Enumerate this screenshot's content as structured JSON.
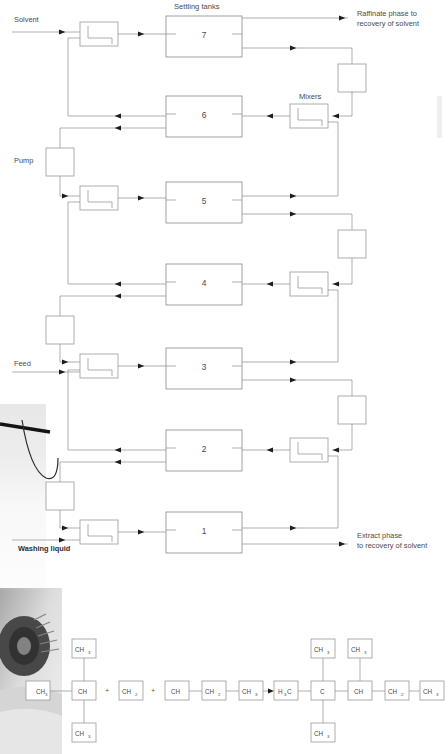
{
  "diagram": {
    "title_settling": "Settling tanks",
    "title_mixers": "Mixers",
    "label_solvent": "Solvent",
    "label_pump": "Pump",
    "label_feed": "Feed",
    "label_washing": "Washing liquid",
    "label_raffinate_1": "Raffinate phase to",
    "label_raffinate_2": "recovery of solvent",
    "label_extract_1": "Extract phase",
    "label_extract_2": "to recovery of solvent",
    "stage_numbers": [
      "7",
      "6",
      "5",
      "4",
      "3",
      "2",
      "1"
    ],
    "colors": {
      "line": "#8d8d8d",
      "box_stroke": "#9a9a9a",
      "text": "#4a4a4a",
      "arrow": "#1c1c1c",
      "background": "#ffffff"
    },
    "stage_rows": [
      {
        "number": "7",
        "y": 16,
        "mixer": "left",
        "pump": "right"
      },
      {
        "number": "6",
        "y": 96,
        "mixer": "right",
        "pump": "none"
      },
      {
        "number": "5",
        "y": 182,
        "mixer": "left",
        "pump": "right"
      },
      {
        "number": "4",
        "y": 264,
        "mixer": "right",
        "pump": "none"
      },
      {
        "number": "3",
        "y": 348,
        "mixer": "left",
        "pump": "right"
      },
      {
        "number": "2",
        "y": 430,
        "mixer": "right",
        "pump": "none"
      },
      {
        "number": "1",
        "y": 512,
        "mixer": "left",
        "pump": "none"
      }
    ]
  },
  "reaction": {
    "reactant_a": {
      "center": "CH",
      "left": "CH3",
      "top": "CH3",
      "bottom": "CH3"
    },
    "reactant_b": [
      "CH2",
      "CH",
      "CH2",
      "CH3"
    ],
    "plus_signs": [
      "+",
      "+"
    ],
    "arrow": "→",
    "product": {
      "chain": [
        "H3C",
        "C",
        "CH",
        "CH2",
        "CH3"
      ],
      "c_top": "CH3",
      "c_bottom": "CH3",
      "ch_top": "CH3"
    },
    "bond": "—",
    "nodes_left": [
      {
        "text": "CH3",
        "base": "CH",
        "sub": "3",
        "x": 26,
        "y": 681,
        "w": 24,
        "h": 19
      },
      {
        "text": "CH",
        "base": "CH",
        "sub": "",
        "x": 72,
        "y": 681,
        "w": 24,
        "h": 19
      },
      {
        "text": "CH3",
        "base": "CH",
        "sub": "3",
        "x": 72,
        "y": 639,
        "w": 24,
        "h": 19
      },
      {
        "text": "CH3",
        "base": "CH",
        "sub": "3",
        "x": 72,
        "y": 723,
        "w": 24,
        "h": 19
      },
      {
        "text": "CH2",
        "base": "CH",
        "sub": "2",
        "x": 119,
        "y": 681,
        "w": 24,
        "h": 19
      },
      {
        "text": "CH",
        "base": "CH",
        "sub": "",
        "x": 165,
        "y": 681,
        "w": 24,
        "h": 19
      },
      {
        "text": "CH2",
        "base": "CH",
        "sub": "2",
        "x": 202,
        "y": 681,
        "w": 24,
        "h": 19
      },
      {
        "text": "CH3",
        "base": "CH",
        "sub": "3",
        "x": 239,
        "y": 681,
        "w": 24,
        "h": 19
      }
    ],
    "nodes_right": [
      {
        "text": "H3C",
        "base": "H",
        "sub": "3",
        "tail": "C",
        "x": 274,
        "y": 681,
        "w": 24,
        "h": 19
      },
      {
        "text": "C",
        "base": "C",
        "sub": "",
        "x": 311,
        "y": 681,
        "w": 24,
        "h": 19
      },
      {
        "text": "CH3",
        "base": "CH",
        "sub": "3",
        "x": 311,
        "y": 639,
        "w": 24,
        "h": 19
      },
      {
        "text": "CH3",
        "base": "CH",
        "sub": "3",
        "x": 311,
        "y": 723,
        "w": 24,
        "h": 19
      },
      {
        "text": "CH",
        "base": "CH",
        "sub": "",
        "x": 348,
        "y": 681,
        "w": 24,
        "h": 19
      },
      {
        "text": "CH3",
        "base": "CH",
        "sub": "3",
        "x": 348,
        "y": 639,
        "w": 24,
        "h": 19
      },
      {
        "text": "CH2",
        "base": "CH",
        "sub": "2",
        "x": 385,
        "y": 681,
        "w": 24,
        "h": 19
      },
      {
        "text": "CH3",
        "base": "CH",
        "sub": "3",
        "x": 420,
        "y": 681,
        "w": 24,
        "h": 19
      }
    ]
  }
}
